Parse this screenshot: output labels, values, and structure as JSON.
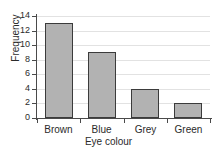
{
  "chart_data": {
    "type": "bar",
    "title": "",
    "categories": [
      "Brown",
      "Blue",
      "Grey",
      "Green"
    ],
    "values": [
      13,
      9,
      4,
      2
    ],
    "xlabel": "Eye colour",
    "ylabel": "Frequency",
    "ylim": [
      0,
      14
    ],
    "ytick_values": [
      0,
      2,
      4,
      6,
      8,
      10,
      12,
      14
    ],
    "ytick_labels": [
      "0",
      "2",
      "4",
      "6",
      "8",
      "10",
      "12",
      "14"
    ],
    "grid": "horizontal",
    "legend": null,
    "bar_fill_color": "#b2b2b2",
    "bar_edge_color": "#3b3b3b",
    "gridline_color": "#e2e2e2",
    "axis_color": "#4a4a4a",
    "background_color": "#ffffff",
    "text_color": "#2b2b2b"
  }
}
